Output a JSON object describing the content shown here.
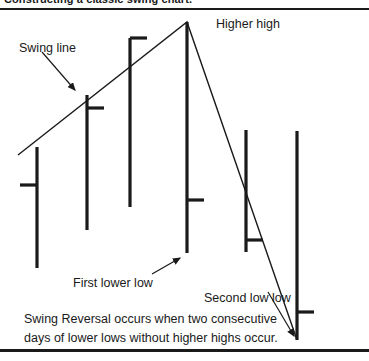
{
  "page": {
    "top_caption": "Constructing a classic swing chart.",
    "background_color": "#ffffff",
    "ink_color": "#1a1a1a",
    "width": 369,
    "height": 361
  },
  "annotations": {
    "swing_line": "Swing line",
    "higher_high": "Higher high",
    "first_lower_low": "First lower low",
    "second_low_low": "Second low low",
    "reversal_caption": "Swing Reversal occurs when two consecutive days of lower lows without higher highs occur."
  },
  "chart_data": {
    "type": "bar",
    "title": "Constructing a classic swing chart.",
    "subtype": "ohlc-bar-swing-chart",
    "xlabel": "",
    "ylabel": "",
    "grid": false,
    "legend": null,
    "axis_note": "y axis inverted in pixel space: smaller y = higher price",
    "categories": [
      "1",
      "2",
      "3",
      "4",
      "5",
      "6",
      "7"
    ],
    "bars": [
      {
        "index": 1,
        "x": 37,
        "high_y": 147,
        "low_y": 268,
        "tick_side": "left",
        "tick_y": 185
      },
      {
        "index": 2,
        "x": 87,
        "high_y": 95,
        "low_y": 230,
        "tick_side": "right",
        "tick_y": 108
      },
      {
        "index": 3,
        "x": 130,
        "high_y": 38,
        "low_y": 207,
        "tick_side": "right",
        "tick_y": 38
      },
      {
        "index": 4,
        "x": 187,
        "high_y": 22,
        "low_y": 253,
        "tick_side": "right",
        "tick_y": 200
      },
      {
        "index": 5,
        "x": 246,
        "high_y": 130,
        "low_y": 252,
        "tick_side": "right",
        "tick_y": 240
      },
      {
        "index": 6,
        "x": 297,
        "high_y": 131,
        "low_y": 340,
        "tick_side": "right",
        "tick_y": 312
      }
    ],
    "swing_line_points": [
      {
        "x": 18,
        "y": 155
      },
      {
        "x": 187,
        "y": 22
      },
      {
        "x": 297,
        "y": 340
      }
    ],
    "arrows": [
      {
        "name": "swing-line-arrow",
        "x1": 42,
        "y1": 52,
        "x2": 75,
        "y2": 90
      },
      {
        "name": "first-lower-low-arrow",
        "x1": 152,
        "y1": 274,
        "x2": 180,
        "y2": 258
      },
      {
        "name": "second-low-low-arrow",
        "x1": 268,
        "y1": 292,
        "x2": 294,
        "y2": 336
      }
    ]
  }
}
